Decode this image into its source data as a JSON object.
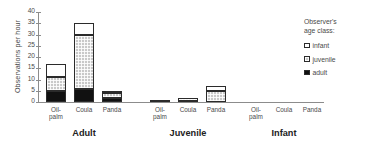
{
  "chart_data": {
    "type": "bar",
    "subtype": "stacked-grouped",
    "title": "",
    "xlabel": "",
    "ylabel": "Observations per hour",
    "ylim": [
      0,
      40
    ],
    "yticks": [
      0,
      5,
      10,
      15,
      20,
      25,
      30,
      35,
      40
    ],
    "ytick_labels": [
      "0",
      "5",
      "10",
      "15",
      "20",
      "25",
      "30",
      "35",
      "40"
    ],
    "grid": false,
    "groups": [
      "Adult",
      "Juvenile",
      "Infant"
    ],
    "categories": [
      "Oil-palm",
      "Coula",
      "Panda"
    ],
    "series": [
      {
        "name": "adult",
        "color": "#111111",
        "values": [
          [
            5,
            6,
            2
          ],
          [
            0,
            0.5,
            0
          ],
          [
            0,
            0,
            0
          ]
        ]
      },
      {
        "name": "juvenile",
        "color": "#c9c9c9",
        "values": [
          [
            6,
            24,
            2
          ],
          [
            1,
            1.5,
            5
          ],
          [
            0,
            0,
            0
          ]
        ]
      },
      {
        "name": "infant",
        "color": "#ffffff",
        "values": [
          [
            6,
            5,
            1
          ],
          [
            0,
            0,
            2
          ],
          [
            0,
            0,
            0
          ]
        ]
      }
    ],
    "totals": [
      [
        17,
        35,
        5
      ],
      [
        1,
        2,
        7
      ],
      [
        0,
        0,
        0
      ]
    ],
    "legend": {
      "position": "right",
      "title": "Observer's\nage class:",
      "entries": [
        {
          "label": "infant",
          "color": "#ffffff"
        },
        {
          "label": "juvenile",
          "color": "#c9c9c9"
        },
        {
          "label": "adult",
          "color": "#111111"
        }
      ]
    }
  },
  "axis": {
    "ylabel": "Observations per hour",
    "ytick_labels": [
      "0",
      "5",
      "10",
      "15",
      "20",
      "25",
      "30",
      "35",
      "40"
    ]
  },
  "groups": [
    {
      "label": "Adult",
      "categories": [
        "Oil-palm",
        "Coula",
        "Panda"
      ]
    },
    {
      "label": "Juvenile",
      "categories": [
        "Oil-palm",
        "Coula",
        "Panda"
      ]
    },
    {
      "label": "Infant",
      "categories": [
        "Oil-palm",
        "Coula",
        "Panda"
      ]
    }
  ],
  "legend": {
    "title": "Observer's\nage class:",
    "entries": [
      {
        "label": "infant"
      },
      {
        "label": "juvenile"
      },
      {
        "label": "adult"
      }
    ]
  }
}
